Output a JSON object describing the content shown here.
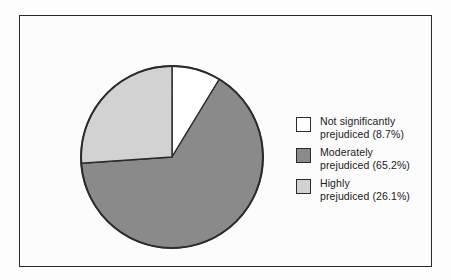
{
  "chart_data": {
    "type": "pie",
    "title": "",
    "subtitle": "",
    "xlabel": "",
    "ylabel": "",
    "legend_position": "right",
    "grid": false,
    "start_angle_deg": 0,
    "direction": "clockwise",
    "categories": [
      "Not significantly prejudiced",
      "Moderately prejudiced",
      "Highly prejudiced"
    ],
    "values": [
      8.7,
      65.2,
      26.1
    ],
    "value_unit": "%",
    "colors": [
      "#ffffff",
      "#8a8a8a",
      "#d2d2d2"
    ],
    "slices": [
      {
        "label": "Not significantly prejudiced",
        "legend_line1": "Not significantly",
        "legend_line2": "prejudiced (8.7%)",
        "value": 8.7,
        "color": "#ffffff"
      },
      {
        "label": "Moderately prejudiced",
        "legend_line1": "Moderately",
        "legend_line2": "prejudiced (65.2%)",
        "value": 65.2,
        "color": "#8a8a8a"
      },
      {
        "label": "Highly prejudiced",
        "legend_line1": "Highly",
        "legend_line2": "prejudiced (26.1%)",
        "value": 26.1,
        "color": "#d2d2d2"
      }
    ]
  },
  "legend": {
    "items": [
      {
        "text": "Not significantly\nprejudiced (8.7%)",
        "swatch": "#ffffff"
      },
      {
        "text": "Moderately\nprejudiced (65.2%)",
        "swatch": "#8a8a8a"
      },
      {
        "text": "Highly\nprejudiced (26.1%)",
        "swatch": "#d2d2d2"
      }
    ]
  },
  "style": {
    "frame_color": "#2a2a2a",
    "outline_color": "#2b2b2b",
    "background": "#fcfcfc"
  }
}
